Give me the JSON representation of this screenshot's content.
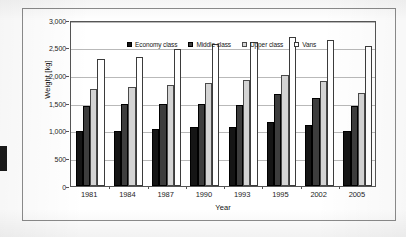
{
  "chart_data": {
    "type": "bar",
    "title": "",
    "subtitle": "",
    "xlabel": "Year",
    "ylabel": "Weight [kg]",
    "categories": [
      "1981",
      "1984",
      "1987",
      "1990",
      "1993",
      "1995",
      "2002",
      "2005"
    ],
    "ylim": [
      0,
      3000
    ],
    "yticks": [
      0,
      500,
      1000,
      1500,
      2000,
      2500,
      3000
    ],
    "ytick_labels": [
      "0",
      "500",
      "1,000",
      "1,500",
      "2,000",
      "2,500",
      "3,000"
    ],
    "grid": true,
    "legend_position": "top-center-inside",
    "series": [
      {
        "name": "Economy class",
        "color": "#151515",
        "values": [
          1000,
          990,
          1030,
          1070,
          1070,
          1160,
          1100,
          990
        ]
      },
      {
        "name": "Middle class",
        "color": "#3d3d3d",
        "values": [
          1450,
          1490,
          1485,
          1480,
          1465,
          1655,
          1595,
          1440
        ]
      },
      {
        "name": "Upper class",
        "color": "#d4d4d4",
        "values": [
          1745,
          1790,
          1830,
          1870,
          1910,
          2010,
          1890,
          1680
        ]
      },
      {
        "name": "Vans",
        "color": "#ffffff",
        "values": [
          2290,
          2340,
          2480,
          2565,
          2605,
          2690,
          2640,
          2535
        ]
      }
    ]
  },
  "figure": {
    "frame_color": "#8c8c8c",
    "plot_border_color": "#555555",
    "gridline_color": "#b9b9b9",
    "background": "#ffffff"
  },
  "artifacts": {
    "edge_mark_label": "scan-edge-artifact"
  }
}
